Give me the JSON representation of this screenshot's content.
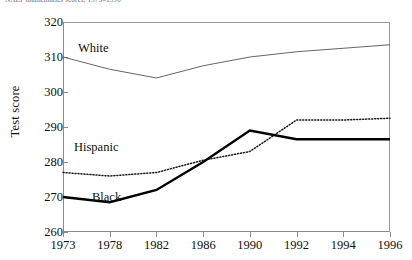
{
  "caption": "NAEP mathematics scores, 1973–1996",
  "chart_data": {
    "type": "line",
    "title": "",
    "xlabel": "",
    "ylabel": "Test score",
    "categories": [
      "1973",
      "1978",
      "1982",
      "1986",
      "1990",
      "1992",
      "1994",
      "1996"
    ],
    "ylim": [
      260,
      320
    ],
    "yticks": [
      260,
      270,
      280,
      290,
      300,
      310,
      320
    ],
    "grid": false,
    "legend_position": "inline-annotations",
    "series": [
      {
        "name": "White",
        "style": "thin-solid",
        "color": "#555555",
        "values": [
          310,
          306.5,
          304,
          307.5,
          310,
          311.5,
          312.5,
          313.5
        ]
      },
      {
        "name": "Hispanic",
        "style": "dotted",
        "color": "#1a1a1a",
        "values": [
          277,
          276,
          277,
          280.5,
          283,
          292,
          292,
          292.5
        ]
      },
      {
        "name": "Black",
        "style": "thick-solid",
        "color": "#000000",
        "values": [
          270,
          268.5,
          272,
          280,
          289,
          286.5,
          286.5,
          286.5
        ]
      }
    ],
    "annotations": [
      {
        "text": "White",
        "series": "White"
      },
      {
        "text": "Hispanic",
        "series": "Hispanic"
      },
      {
        "text": "Black",
        "series": "Black"
      }
    ]
  }
}
